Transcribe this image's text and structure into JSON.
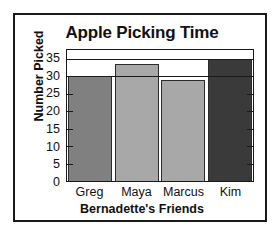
{
  "chart_data": {
    "type": "bar",
    "title": "Apple Picking Time",
    "xlabel": "Bernadette's Friends",
    "ylabel": "Number Picked",
    "categories": [
      "Greg",
      "Maya",
      "Marcus",
      "Kim"
    ],
    "values": [
      30,
      33.5,
      29,
      35
    ],
    "bar_colors": [
      "#808080",
      "#a8a8a8",
      "#a8a8a8",
      "#3a3a3a"
    ],
    "ylim": [
      0,
      37.5
    ],
    "yticks": [
      0,
      5,
      10,
      15,
      20,
      25,
      30,
      35
    ],
    "ytick_labels": [
      "0",
      "5",
      "10",
      "15",
      "20",
      "25",
      "30",
      "35"
    ],
    "gridlines": [
      30,
      35
    ],
    "grid": true,
    "legend": null,
    "legend_position": "none",
    "frame": true,
    "tick_direction": "in",
    "axis_color": "#1a1a1a",
    "text_color": "#111111",
    "background": "#ffffff"
  }
}
